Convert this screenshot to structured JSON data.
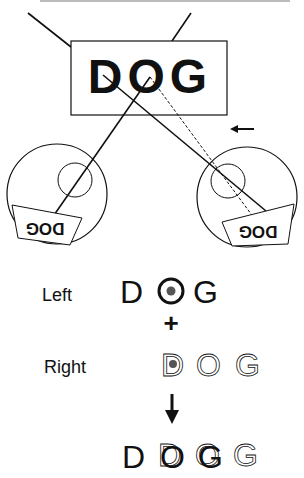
{
  "scene": {
    "stimulus_word": "DOG",
    "left_eye_image": "DOG",
    "right_eye_image": "DOG"
  },
  "perception": {
    "left_label": "Left",
    "right_label": "Right",
    "plus_symbol": "+",
    "left_letters": [
      "D",
      "O",
      "G"
    ],
    "right_letters": [
      "D",
      "O",
      "G"
    ],
    "fused_letters": [
      "D",
      "O",
      "G",
      "G"
    ]
  },
  "colors": {
    "ink": "#111111",
    "dot": "#555555",
    "background": "#ffffff"
  }
}
